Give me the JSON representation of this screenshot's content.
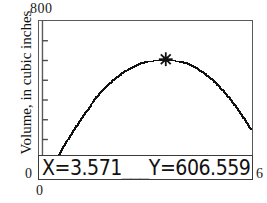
{
  "chart_data": {
    "type": "scatter",
    "title": "",
    "xlabel": "0",
    "ylabel": "Volume, in cubic inches",
    "xlim": [
      0,
      6
    ],
    "ylim": [
      0,
      800
    ],
    "x_tick_labels": [
      "0",
      "6"
    ],
    "y_tick_labels": [
      "0",
      "800"
    ],
    "y_tick_count": 7,
    "grid": false,
    "legend": "none",
    "curve_description": "plotted volume function, dotted pixel trace, rises from left, maximum near x=3.571, then falls",
    "x": [
      0.26,
      0.4,
      0.55,
      0.7,
      0.85,
      1.0,
      1.15,
      1.3,
      1.45,
      1.6,
      1.75,
      1.9,
      2.05,
      2.2,
      2.35,
      2.5,
      2.65,
      2.8,
      2.95,
      3.1,
      3.25,
      3.4,
      3.571,
      3.7,
      3.85,
      4.0,
      4.15,
      4.3,
      4.45,
      4.6,
      4.75,
      4.9,
      5.05,
      5.2,
      5.35,
      5.5,
      5.65,
      5.8,
      5.95
    ],
    "y": [
      18,
      72,
      128,
      178,
      224,
      268,
      310,
      348,
      384,
      418,
      448,
      476,
      500,
      522,
      542,
      558,
      572,
      584,
      594,
      600,
      604,
      606,
      606.559,
      605,
      601,
      595,
      586,
      574,
      560,
      543,
      523,
      500,
      474,
      445,
      413,
      378,
      340,
      299,
      255
    ],
    "cursor": {
      "x": 3.571,
      "y": 606.559,
      "marker": "star-cross"
    }
  },
  "axes": {
    "y_max_label": "800",
    "y_min_label": "0",
    "x_min_label": "0",
    "x_max_label": "6",
    "y_title": "Volume, in cubic inches"
  },
  "readout": {
    "text": "X=3.571___Y=606.559",
    "x_value": "X=3.571",
    "y_value": "Y=606.559",
    "separator": "___"
  },
  "colors": {
    "background": "#ffffff",
    "frame": "#5a5a5a",
    "trace": "#111111",
    "text": "#1a1a1a"
  }
}
